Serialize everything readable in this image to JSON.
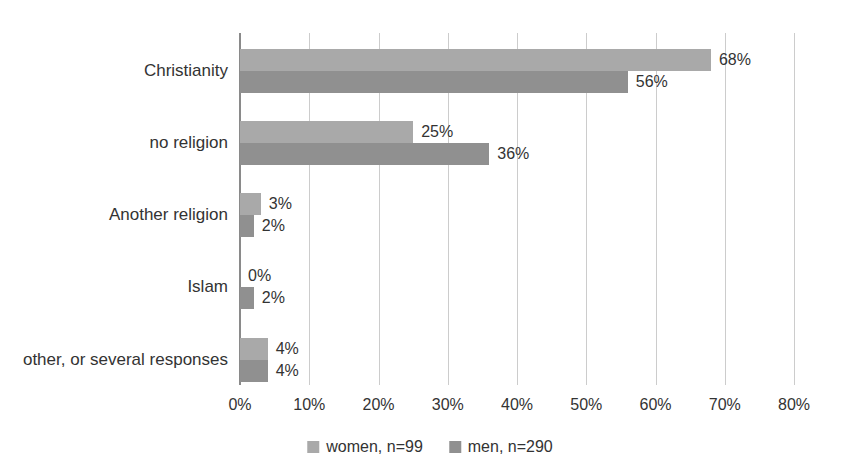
{
  "chart_data": {
    "type": "bar",
    "orientation": "horizontal",
    "title": "",
    "xlabel": "",
    "ylabel": "",
    "categories": [
      "Christianity",
      "no religion",
      "Another religion",
      "Islam",
      "other, or several responses"
    ],
    "series": [
      {
        "name": "women, n=99",
        "color": "#a9a9a9",
        "values": [
          68,
          25,
          3,
          0,
          4
        ],
        "labels": [
          "68%",
          "25%",
          "3%",
          "0%",
          "4%"
        ]
      },
      {
        "name": "men, n=290",
        "color": "#909090",
        "values": [
          56,
          36,
          2,
          2,
          4
        ],
        "labels": [
          "56%",
          "36%",
          "2%",
          "2%",
          "4%"
        ]
      }
    ],
    "xlim": [
      0,
      80
    ],
    "x_ticks": [
      "0%",
      "10%",
      "20%",
      "30%",
      "40%",
      "50%",
      "60%",
      "70%",
      "80%"
    ],
    "x_tick_values": [
      0,
      10,
      20,
      30,
      40,
      50,
      60,
      70,
      80
    ],
    "grid": "vertical",
    "legend_position": "bottom",
    "colors": {
      "background": "#ffffff",
      "gridline": "#cccccc",
      "axis_line": "#8a8a8a",
      "text": "#333333"
    }
  }
}
